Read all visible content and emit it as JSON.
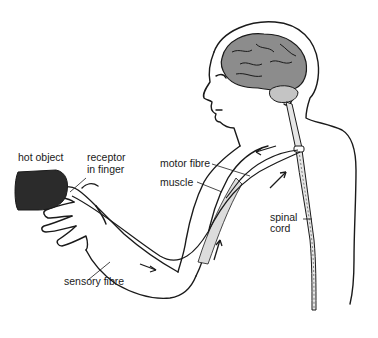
{
  "diagram": {
    "labels": {
      "hot_object": "hot object",
      "receptor_line1": "receptor",
      "receptor_line2": "in finger",
      "motor_fibre": "motor fibre",
      "muscle": "muscle",
      "spinal_line1": "spinal",
      "spinal_line2": "cord",
      "sensory_fibre": "sensory fibre"
    },
    "colors": {
      "line": "#1a1a1a",
      "brain_fill": "#8c8c8c",
      "hot_object_fill": "#2b2b2b",
      "muscle_fill": "#dcdcdc",
      "cord_fill": "#e6e6e6",
      "background": "#ffffff"
    }
  }
}
